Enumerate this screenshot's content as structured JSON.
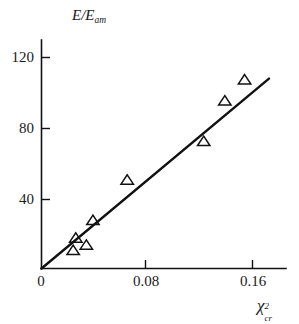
{
  "chart_data": {
    "type": "scatter",
    "title": "",
    "subtitle": "",
    "xlabel": "χ²cr",
    "ylabel": "E/Eam",
    "xlabel_parts": {
      "symbol": "χ",
      "superscript": "2",
      "subscript": "cr"
    },
    "ylabel_parts": {
      "numerator": "E",
      "denominator": "E",
      "denominator_subscript": "am",
      "separator": "/"
    },
    "xlim": [
      0,
      0.183
    ],
    "ylim": [
      0,
      134
    ],
    "grid": false,
    "legend": null,
    "xticks": [
      0,
      0.08,
      0.16
    ],
    "xtick_labels": [
      "0",
      "0.08",
      "0.16"
    ],
    "yticks": [
      40,
      80,
      120
    ],
    "ytick_labels": [
      "40",
      "80",
      "120"
    ],
    "x": [
      0.024,
      0.026,
      0.034,
      0.039,
      0.065,
      0.123,
      0.139,
      0.154
    ],
    "y": [
      10,
      17,
      13,
      27,
      50,
      72,
      95,
      107
    ],
    "marker": "triangle-up",
    "marker_fill": "none",
    "series": [
      {
        "name": "measurements",
        "points": [
          {
            "x": 0.024,
            "y": 10
          },
          {
            "x": 0.026,
            "y": 17
          },
          {
            "x": 0.034,
            "y": 13
          },
          {
            "x": 0.039,
            "y": 27
          },
          {
            "x": 0.065,
            "y": 50
          },
          {
            "x": 0.123,
            "y": 72
          },
          {
            "x": 0.139,
            "y": 95
          },
          {
            "x": 0.154,
            "y": 107
          }
        ]
      }
    ],
    "fit_line": {
      "name": "linear-fit",
      "x_start": 0.0,
      "y_start": 0.0,
      "x_end": 0.1725,
      "y_end": 108.0,
      "slope": 626,
      "intercept": 0
    },
    "colors": {
      "axis": "#111111",
      "line": "#111111",
      "marker": "#111111",
      "background": "#ffffff"
    }
  }
}
